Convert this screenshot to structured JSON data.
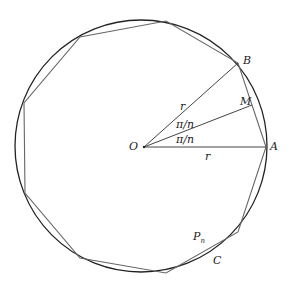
{
  "figure": {
    "circle": {
      "cx": 141,
      "cy": 146,
      "r": 126,
      "stroke": "#222222"
    },
    "polygon": {
      "points": "266,147 238,63 166,21 80,37 24,103 25,193 80,258 166,273 238,232",
      "stroke": "#666666"
    },
    "radii": [
      {
        "from": [
          144,
          147
        ],
        "to": [
          266,
          147
        ]
      },
      {
        "from": [
          144,
          147
        ],
        "to": [
          238,
          63
        ]
      },
      {
        "from": [
          144,
          147
        ],
        "to": [
          252,
          105
        ]
      }
    ],
    "labels": {
      "O": "O",
      "A": "A",
      "B": "B",
      "M": "M",
      "r_upper": "r",
      "r_lower": "r",
      "angle_upper": "π/n",
      "angle_lower": "π/n",
      "Pn": "P",
      "Pn_sub": "n",
      "C": "C"
    }
  }
}
